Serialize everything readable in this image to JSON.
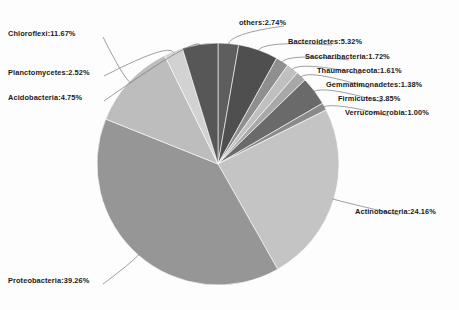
{
  "chart_data": {
    "type": "pie",
    "title": "",
    "subtitle": "",
    "xlabel": "",
    "ylabel": "",
    "grid": false,
    "legend_position": "none",
    "label_format": "name:value%",
    "start_angle_deg": 0,
    "direction": "clockwise",
    "units": "percent",
    "total": 99.98,
    "categories": [
      "others",
      "Bacteroidetes",
      "Saccharibacteria",
      "Thaumarchaeota",
      "Gemmatimonadetes",
      "Firmicutes",
      "Verrucomicrobia",
      "Actinobacteria",
      "Proteobacteria",
      "Chloroflexi",
      "Planctomycetes",
      "Acidobacteria"
    ],
    "values": [
      2.74,
      5.32,
      1.72,
      1.61,
      1.38,
      3.85,
      1.0,
      24.16,
      39.26,
      11.67,
      2.52,
      4.75
    ],
    "colors": [
      "#5e5e5e",
      "#4f4f4f",
      "#8f8f8f",
      "#c0c0c0",
      "#a8a8a8",
      "#6a6a6a",
      "#8a8a8a",
      "#c4c4c4",
      "#969696",
      "#bdbdbd",
      "#d2d2d2",
      "#575757"
    ],
    "slices": [
      {
        "label": "others:2.74%",
        "name": "others",
        "value": 2.74,
        "color": "#5e5e5e"
      },
      {
        "label": "Bacteroidetes:5.32%",
        "name": "Bacteroidetes",
        "value": 5.32,
        "color": "#4f4f4f"
      },
      {
        "label": "Saccharibacteria:1.72%",
        "name": "Saccharibacteria",
        "value": 1.72,
        "color": "#8f8f8f"
      },
      {
        "label": "Thaumarchaeota:1.61%",
        "name": "Thaumarchaeota",
        "value": 1.61,
        "color": "#c0c0c0"
      },
      {
        "label": "Gemmatimonadetes:1.38%",
        "name": "Gemmatimonadetes",
        "value": 1.38,
        "color": "#a8a8a8"
      },
      {
        "label": "Firmicutes:3.85%",
        "name": "Firmicutes",
        "value": 3.85,
        "color": "#6a6a6a"
      },
      {
        "label": "Verrucomicrobia:1.00%",
        "name": "Verrucomicrobia",
        "value": 1.0,
        "color": "#8a8a8a"
      },
      {
        "label": "Actinobacteria:24.16%",
        "name": "Actinobacteria",
        "value": 24.16,
        "color": "#c4c4c4"
      },
      {
        "label": "Proteobacteria:39.26%",
        "name": "Proteobacteria",
        "value": 39.26,
        "color": "#969696"
      },
      {
        "label": "Chloroflexi:11.67%",
        "name": "Chloroflexi",
        "value": 11.67,
        "color": "#bdbdbd"
      },
      {
        "label": "Planctomycetes:2.52%",
        "name": "Planctomycetes",
        "value": 2.52,
        "color": "#d2d2d2"
      },
      {
        "label": "Acidobacteria:4.75%",
        "name": "Acidobacteria",
        "value": 4.75,
        "color": "#575757"
      }
    ]
  },
  "geometry": {
    "center_x": 218,
    "center_y": 164,
    "radius": 121
  }
}
